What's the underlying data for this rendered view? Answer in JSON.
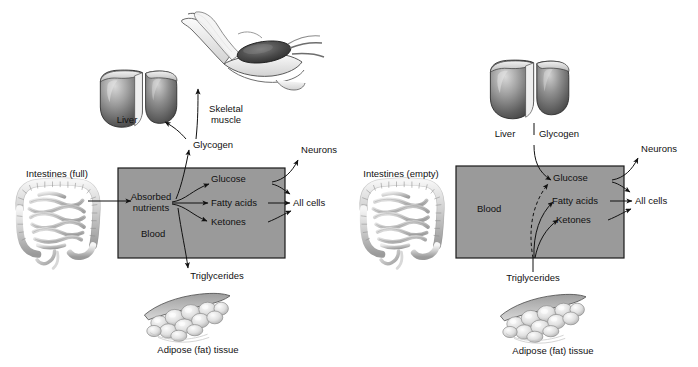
{
  "figure": {
    "box_fill": "#9a9a9a",
    "box_stroke": "#1a1a1a",
    "text_color": "#111111"
  },
  "panels": [
    {
      "id": "left",
      "state_label": "absorptive",
      "intestines_label": "Intestines (full)",
      "blood_label": "Blood",
      "liver_label": "Liver",
      "glycogen_label": "Glycogen",
      "skeletal_muscle_label": "Skeletal\nmuscle",
      "skeletal_muscle_line1": "Skeletal",
      "skeletal_muscle_line2": "muscle",
      "absorbed_nutrients_line1": "Absorbed",
      "absorbed_nutrients_line2": "nutrients",
      "fuels": [
        "Glucose",
        "Fatty acids",
        "Ketones"
      ],
      "neurons_label": "Neurons",
      "all_cells_label": "All cells",
      "triglycerides_label": "Triglycerides",
      "adipose_label": "Adipose (fat) tissue",
      "triglyceride_flow": "down-to-adipose",
      "intestines_connected": true,
      "has_skeletal_muscle": true
    },
    {
      "id": "right",
      "state_label": "postabsorptive",
      "intestines_label": "Intestines (empty)",
      "blood_label": "Blood",
      "liver_label": "Liver",
      "glycogen_label": "Glycogen",
      "fuels": [
        "Glucose",
        "Fatty acids",
        "Ketones"
      ],
      "neurons_label": "Neurons",
      "all_cells_label": "All cells",
      "triglycerides_label": "Triglycerides",
      "adipose_label": "Adipose (fat) tissue",
      "triglyceride_flow": "up-into-blood",
      "intestines_connected": false,
      "has_skeletal_muscle": false
    }
  ]
}
